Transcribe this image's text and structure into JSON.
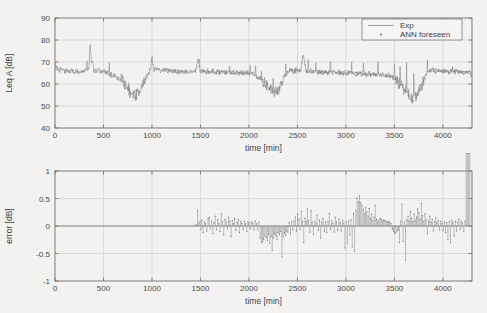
{
  "figure": {
    "background_color": "#f3f2f0",
    "line_color": "#8a8a8a",
    "axis_color": "#6e6e6e",
    "grid_color": "#c9c9c9"
  },
  "chart_data": [
    {
      "id": "leq-plot",
      "type": "line",
      "title": "",
      "xlabel": "time [min]",
      "ylabel": "Leq A [dB]",
      "xlim": [
        0,
        4300
      ],
      "ylim": [
        40,
        90
      ],
      "xticks": [
        0,
        500,
        1000,
        1500,
        2000,
        2500,
        3000,
        3500,
        4000
      ],
      "yticks": [
        40,
        50,
        60,
        70,
        80,
        90
      ],
      "xticklabels": [
        "0",
        "500",
        "1000",
        "1500",
        "2000",
        "2500",
        "3000",
        "3500",
        "4000"
      ],
      "yticklabels": [
        "40",
        "50",
        "60",
        "70",
        "80",
        "90"
      ],
      "grid": true,
      "legend_position": "top-right",
      "legend": [
        {
          "label": "Exp",
          "marker": "line"
        },
        {
          "label": "ANN foreseen",
          "marker": "point"
        }
      ],
      "series": [
        {
          "name": "Exp",
          "style": "line",
          "x": [
            0,
            25,
            50,
            75,
            100,
            125,
            150,
            175,
            200,
            225,
            250,
            275,
            300,
            325,
            350,
            360,
            375,
            385,
            400,
            425,
            450,
            475,
            500,
            525,
            550,
            575,
            600,
            625,
            650,
            675,
            700,
            715,
            730,
            745,
            760,
            775,
            790,
            800,
            815,
            830,
            845,
            860,
            880,
            900,
            920,
            940,
            960,
            980,
            1000,
            1010,
            1025,
            1050,
            1075,
            1100,
            1125,
            1150,
            1175,
            1200,
            1225,
            1250,
            1275,
            1300,
            1325,
            1350,
            1375,
            1400,
            1425,
            1450,
            1475,
            1490,
            1510,
            1535,
            1560,
            1585,
            1610,
            1635,
            1660,
            1685,
            1710,
            1735,
            1760,
            1785,
            1810,
            1835,
            1860,
            1885,
            1910,
            1935,
            1960,
            1985,
            2010,
            2035,
            2060,
            2085,
            2110,
            2135,
            2160,
            2185,
            2210,
            2235,
            2260,
            2280,
            2300,
            2320,
            2340,
            2360,
            2385,
            2410,
            2435,
            2460,
            2485,
            2510,
            2535,
            2560,
            2585,
            2610,
            2635,
            2660,
            2685,
            2710,
            2735,
            2760,
            2785,
            2810,
            2835,
            2860,
            2885,
            2910,
            2935,
            2960,
            2985,
            3010,
            3035,
            3060,
            3085,
            3110,
            3135,
            3160,
            3185,
            3210,
            3235,
            3260,
            3285,
            3310,
            3335,
            3360,
            3385,
            3410,
            3435,
            3460,
            3485,
            3510,
            3535,
            3560,
            3585,
            3610,
            3635,
            3655,
            3675,
            3695,
            3715,
            3740,
            3765,
            3790,
            3815,
            3840,
            3865,
            3890,
            3915,
            3940,
            3965,
            3990,
            4015,
            4040,
            4065,
            4090,
            4115,
            4140,
            4165,
            4190,
            4215,
            4240,
            4265,
            4290
          ],
          "y": [
            68.5,
            67.2,
            66.4,
            66.8,
            65.9,
            66.3,
            65.6,
            66.1,
            65.4,
            66.0,
            65.3,
            66.4,
            65.8,
            67.3,
            66.2,
            77.5,
            68.4,
            70.1,
            66.5,
            65.8,
            66.2,
            65.4,
            66.0,
            65.1,
            64.8,
            64.2,
            63.9,
            63.4,
            62.8,
            62.1,
            61.4,
            60.3,
            59.2,
            58.1,
            57.0,
            55.8,
            54.6,
            53.9,
            55.2,
            54.1,
            56.0,
            55.3,
            57.8,
            59.4,
            61.2,
            63.1,
            64.8,
            65.9,
            72.1,
            67.0,
            66.3,
            66.8,
            66.1,
            66.5,
            65.9,
            66.4,
            65.8,
            66.2,
            65.7,
            66.1,
            65.5,
            66.0,
            65.4,
            65.9,
            65.3,
            65.8,
            65.2,
            65.7,
            71.8,
            66.0,
            65.6,
            66.1,
            65.5,
            66.0,
            65.4,
            65.9,
            65.3,
            65.8,
            65.2,
            65.7,
            65.1,
            65.6,
            65.0,
            65.5,
            64.9,
            65.4,
            64.8,
            65.3,
            64.7,
            65.2,
            64.6,
            65.1,
            64.0,
            63.2,
            62.4,
            61.5,
            60.6,
            59.4,
            58.2,
            57.0,
            56.2,
            57.1,
            56.0,
            58.3,
            60.5,
            62.8,
            64.6,
            65.9,
            66.4,
            65.8,
            66.3,
            65.7,
            66.2,
            74.0,
            66.0,
            65.5,
            66.0,
            65.4,
            65.9,
            65.3,
            65.8,
            65.2,
            65.7,
            65.1,
            65.6,
            65.0,
            65.5,
            64.9,
            65.4,
            64.8,
            65.3,
            64.7,
            65.2,
            64.6,
            65.1,
            64.5,
            65.0,
            64.4,
            64.9,
            64.3,
            64.8,
            64.2,
            64.7,
            64.1,
            64.6,
            64.0,
            64.5,
            63.9,
            64.4,
            63.5,
            62.8,
            61.9,
            60.8,
            59.6,
            58.3,
            57.0,
            55.8,
            54.5,
            53.2,
            52.6,
            54.0,
            55.8,
            58.1,
            60.5,
            62.8,
            64.8,
            65.9,
            66.4,
            65.8,
            66.3,
            65.7,
            66.2,
            65.6,
            66.1,
            65.5,
            66.0,
            65.4,
            65.9,
            65.3,
            65.8,
            65.2,
            65.7,
            65.1,
            65.6,
            65.0,
            64.2
          ]
        },
        {
          "name": "ANN foreseen",
          "style": "points",
          "note": "overlaid marker points coincident with Exp curve from ~1450 min onward"
        }
      ]
    },
    {
      "id": "error-plot",
      "type": "line",
      "title": "",
      "xlabel": "time [min]",
      "ylabel": "error [dB]",
      "xlim": [
        0,
        4300
      ],
      "ylim": [
        -1,
        1
      ],
      "xticks": [
        0,
        500,
        1000,
        1500,
        2000,
        2500,
        3000,
        3500,
        4000
      ],
      "yticks": [
        -1,
        -0.5,
        0,
        0.5,
        1
      ],
      "xticklabels": [
        "0",
        "500",
        "1000",
        "1500",
        "2000",
        "2500",
        "3000",
        "3500",
        "4000"
      ],
      "yticklabels": [
        "-1",
        "-0.5",
        "0",
        "0.5",
        "1"
      ],
      "grid": true,
      "series": [
        {
          "name": "error",
          "style": "stem",
          "x": [
            1455,
            1470,
            1482,
            1495,
            1505,
            1515,
            1528,
            1540,
            1552,
            1565,
            1578,
            1590,
            1602,
            1615,
            1628,
            1640,
            1652,
            1665,
            1678,
            1690,
            1702,
            1715,
            1728,
            1740,
            1752,
            1765,
            1778,
            1790,
            1802,
            1815,
            1828,
            1840,
            1852,
            1865,
            1878,
            1890,
            1902,
            1915,
            1928,
            1940,
            1952,
            1965,
            1978,
            1990,
            2002,
            2015,
            2028,
            2040,
            2052,
            2065,
            2078,
            2090,
            2102,
            2115,
            2128,
            2140,
            2152,
            2165,
            2178,
            2190,
            2202,
            2215,
            2228,
            2240,
            2252,
            2265,
            2278,
            2290,
            2302,
            2315,
            2328,
            2340,
            2352,
            2365,
            2378,
            2390,
            2402,
            2415,
            2428,
            2440,
            2452,
            2465,
            2478,
            2490,
            2502,
            2515,
            2528,
            2540,
            2552,
            2565,
            2578,
            2590,
            2602,
            2615,
            2628,
            2640,
            2652,
            2665,
            2678,
            2690,
            2702,
            2715,
            2728,
            2740,
            2752,
            2765,
            2778,
            2790,
            2802,
            2815,
            2828,
            2840,
            2852,
            2865,
            2878,
            2890,
            2902,
            2915,
            2928,
            2940,
            2952,
            2965,
            2978,
            2990,
            3002,
            3015,
            3028,
            3040,
            3052,
            3065,
            3078,
            3090,
            3102,
            3115,
            3128,
            3140,
            3152,
            3165,
            3178,
            3190,
            3202,
            3215,
            3228,
            3240,
            3252,
            3265,
            3278,
            3290,
            3302,
            3315,
            3328,
            3340,
            3352,
            3365,
            3378,
            3390,
            3402,
            3415,
            3428,
            3440,
            3452,
            3465,
            3478,
            3490,
            3502,
            3515,
            3528,
            3540,
            3552,
            3565,
            3578,
            3590,
            3602,
            3615,
            3628,
            3640,
            3652,
            3665,
            3678,
            3690,
            3702,
            3715,
            3728,
            3740,
            3752,
            3765,
            3778,
            3790,
            3802,
            3815,
            3828,
            3840,
            3852,
            3865,
            3878,
            3890,
            3902,
            3915,
            3928,
            3940,
            3952,
            3965,
            3978,
            3990,
            4002,
            4015,
            4028,
            4040,
            4052,
            4065,
            4078,
            4090,
            4102,
            4115,
            4128,
            4140,
            4152,
            4165,
            4178,
            4190,
            4202,
            4215,
            4228,
            4240,
            4252,
            4265,
            4278
          ],
          "y": [
            0.02,
            0.28,
            0.05,
            0.09,
            -0.06,
            0.11,
            -0.12,
            0.07,
            0.04,
            -0.09,
            0.13,
            0.16,
            -0.05,
            0.09,
            -0.14,
            0.06,
            0.18,
            -0.07,
            0.11,
            0.05,
            -0.1,
            0.22,
            0.08,
            -0.16,
            0.12,
            0.07,
            -0.05,
            0.16,
            0.09,
            -0.19,
            0.1,
            0.05,
            0.14,
            -0.08,
            0.06,
            0.11,
            -0.12,
            0.08,
            0.05,
            -0.06,
            0.09,
            0.04,
            -0.1,
            0.07,
            0.06,
            -0.05,
            0.08,
            0.05,
            -0.07,
            0.09,
            0.04,
            -0.06,
            0.07,
            -0.22,
            -0.3,
            -0.28,
            -0.24,
            -0.18,
            -0.21,
            -0.26,
            -0.15,
            -0.31,
            -0.19,
            -0.44,
            -0.22,
            -0.14,
            -0.18,
            -0.25,
            -0.12,
            -0.16,
            -0.1,
            -0.56,
            -0.2,
            -0.13,
            -0.17,
            -0.09,
            -0.11,
            0.06,
            -0.14,
            0.08,
            -0.07,
            0.1,
            0.16,
            -0.09,
            0.22,
            0.12,
            -0.06,
            0.26,
            0.09,
            -0.3,
            0.14,
            0.08,
            0.31,
            0.1,
            -0.11,
            0.28,
            0.07,
            -0.15,
            0.09,
            0.05,
            0.2,
            -0.08,
            0.11,
            -0.22,
            0.07,
            0.14,
            -0.09,
            0.08,
            -0.12,
            0.09,
            0.23,
            -0.06,
            0.1,
            0.05,
            -0.11,
            0.16,
            0.07,
            -0.08,
            0.12,
            0.06,
            -0.09,
            0.1,
            0.05,
            -0.4,
            0.08,
            -0.32,
            0.09,
            -0.16,
            0.11,
            -0.38,
            0.23,
            -0.46,
            0.28,
            0.51,
            0.44,
            0.55,
            0.42,
            0.38,
            0.3,
            0.22,
            0.34,
            0.26,
            0.18,
            0.32,
            0.14,
            0.21,
            0.1,
            0.16,
            0.38,
            0.12,
            0.07,
            0.1,
            0.14,
            0.12,
            0.09,
            0.11,
            0.1,
            0.08,
            0.07,
            0.09,
            0.06,
            0.05,
            -0.06,
            -0.1,
            -0.14,
            -0.12,
            -0.09,
            -0.07,
            -0.3,
            0.09,
            0.4,
            -0.28,
            0.07,
            -0.62,
            0.11,
            0.18,
            0.09,
            0.26,
            0.14,
            0.08,
            0.22,
            0.1,
            0.16,
            0.31,
            0.25,
            0.12,
            0.41,
            0.19,
            0.08,
            0.22,
            0.11,
            -0.14,
            0.09,
            0.18,
            0.07,
            0.12,
            -0.09,
            0.08,
            0.15,
            0.06,
            0.1,
            -0.07,
            0.09,
            0.05,
            -0.08,
            0.07,
            -0.12,
            0.06,
            -0.25,
            0.08,
            -0.3,
            0.1,
            0.06,
            -0.18,
            0.09,
            -0.09,
            0.07,
            0.12,
            -0.06,
            0.08,
            0.05,
            -0.1,
            0.09
          ]
        }
      ]
    }
  ]
}
